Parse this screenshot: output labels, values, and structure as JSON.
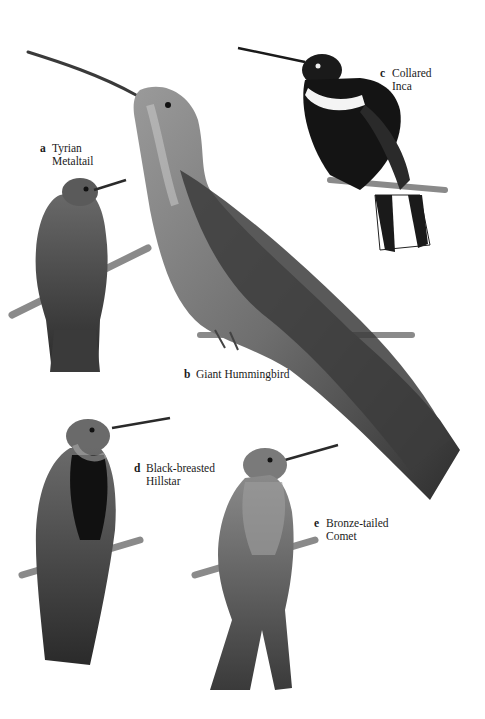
{
  "plate": {
    "species": [
      {
        "letter": "a",
        "name_line1": "Tyrian",
        "name_line2": "Metaltail"
      },
      {
        "letter": "b",
        "name_line1": "Giant Hummingbird",
        "name_line2": ""
      },
      {
        "letter": "c",
        "name_line1": "Collared",
        "name_line2": "Inca"
      },
      {
        "letter": "d",
        "name_line1": "Black-breasted",
        "name_line2": "Hillstar"
      },
      {
        "letter": "e",
        "name_line1": "Bronze-tailed",
        "name_line2": "Comet"
      }
    ]
  }
}
